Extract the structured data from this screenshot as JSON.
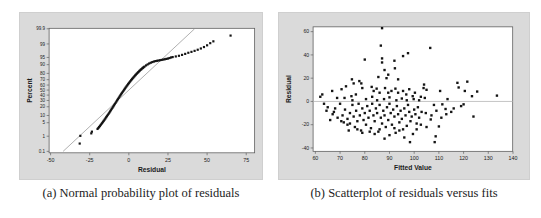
{
  "captions": {
    "a": "(a) Normal probability plot of residuals",
    "b": "(b) Scatterplot of residuals versus fits"
  },
  "colors": {
    "panel_bg": "#dadada",
    "plot_bg": "#ffffff",
    "frame": "#5f5f5f",
    "point": "#141414",
    "fit_line": "#8d8d8d",
    "ref_line": "#b4b4b4",
    "tick_text": "#1a1a1a"
  },
  "chart_data": [
    {
      "id": "a",
      "type": "scatter",
      "scale": "normal-probability",
      "title": "",
      "xlabel": "Residual",
      "ylabel": "Percent",
      "xticks": [
        -50,
        -25,
        0,
        25,
        50,
        75
      ],
      "yticks": [
        99.9,
        99,
        95,
        90,
        80,
        70,
        60,
        50,
        40,
        30,
        20,
        10,
        5,
        1,
        0.1
      ],
      "xlim": [
        -51,
        80
      ],
      "percent_lim": [
        0.1,
        99.9
      ],
      "legend": "none",
      "grid": false,
      "fit_line": {
        "x": [
          -42,
          42
        ],
        "percent": [
          0.1,
          99.9
        ]
      },
      "points": [
        [
          -31.4,
          0.35
        ],
        [
          -31,
          1.05
        ],
        [
          -24,
          1.45
        ],
        [
          -23.6,
          1.8
        ],
        [
          -20,
          2.5
        ],
        [
          -19.5,
          2.8
        ],
        [
          -19,
          3.1
        ],
        [
          -18.5,
          3.5
        ],
        [
          -18,
          3.9
        ],
        [
          -17.5,
          4.4
        ],
        [
          -17,
          4.9
        ],
        [
          -16.5,
          5.5
        ],
        [
          -16,
          6.1
        ],
        [
          -15.5,
          6.8
        ],
        [
          -15,
          7.6
        ],
        [
          -14.5,
          8.5
        ],
        [
          -14,
          9.4
        ],
        [
          -13.5,
          10.4
        ],
        [
          -13,
          11.5
        ],
        [
          -12.5,
          12.7
        ],
        [
          -12,
          14
        ],
        [
          -11.5,
          15.4
        ],
        [
          -11,
          16.9
        ],
        [
          -10.5,
          18.5
        ],
        [
          -10,
          20.2
        ],
        [
          -9.5,
          22
        ],
        [
          -9,
          23.9
        ],
        [
          -8.5,
          25.9
        ],
        [
          -8,
          28
        ],
        [
          -7.5,
          30.1
        ],
        [
          -7,
          32.3
        ],
        [
          -6.5,
          34.6
        ],
        [
          -6,
          36.9
        ],
        [
          -5.5,
          39.2
        ],
        [
          -5,
          41.5
        ],
        [
          -4.5,
          43.8
        ],
        [
          -4,
          46.1
        ],
        [
          -3.5,
          48.4
        ],
        [
          -3,
          50.7
        ],
        [
          -2.5,
          53
        ],
        [
          -2,
          55.2
        ],
        [
          -1.5,
          57.4
        ],
        [
          -1,
          59.5
        ],
        [
          -0.5,
          61.6
        ],
        [
          0,
          63.6
        ],
        [
          0.5,
          65.5
        ],
        [
          1,
          67.4
        ],
        [
          1.5,
          69.2
        ],
        [
          2,
          70.9
        ],
        [
          2.5,
          72.5
        ],
        [
          3,
          74
        ],
        [
          3.5,
          75.5
        ],
        [
          4,
          76.9
        ],
        [
          4.5,
          78.2
        ],
        [
          5,
          79.4
        ],
        [
          5.5,
          80.6
        ],
        [
          6,
          81.7
        ],
        [
          6.5,
          82.7
        ],
        [
          7,
          83.7
        ],
        [
          7.5,
          84.6
        ],
        [
          8,
          85.4
        ],
        [
          8.5,
          86.2
        ],
        [
          9,
          86.9
        ],
        [
          9.5,
          87.6
        ],
        [
          10,
          88.2
        ],
        [
          11,
          89.3
        ],
        [
          12,
          90.2
        ],
        [
          13,
          91
        ],
        [
          14,
          91.6
        ],
        [
          15,
          92.1
        ],
        [
          16,
          92.5
        ],
        [
          17,
          92.8
        ],
        [
          18,
          93
        ],
        [
          19,
          93.2
        ],
        [
          20,
          93.4
        ],
        [
          21,
          93.6
        ],
        [
          22,
          93.8
        ],
        [
          23,
          94
        ],
        [
          24,
          94.2
        ],
        [
          25,
          94.4
        ],
        [
          26,
          94.7
        ],
        [
          27,
          95
        ],
        [
          28,
          95.2
        ],
        [
          30,
          95.5
        ],
        [
          32,
          95.8
        ],
        [
          34,
          96.2
        ],
        [
          36,
          96.6
        ],
        [
          38,
          97
        ],
        [
          40,
          97.3
        ],
        [
          42,
          97.6
        ],
        [
          44,
          97.9
        ],
        [
          46,
          98.2
        ],
        [
          48,
          98.5
        ],
        [
          50,
          98.8
        ],
        [
          52,
          99.1
        ],
        [
          54,
          99.3
        ],
        [
          65,
          99.7
        ]
      ]
    },
    {
      "id": "b",
      "type": "scatter",
      "xlabel": "Fitted Value",
      "ylabel": "Residual",
      "xticks": [
        60,
        70,
        80,
        90,
        100,
        110,
        120,
        130,
        140
      ],
      "yticks": [
        60,
        40,
        20,
        0,
        -20,
        -40
      ],
      "xlim": [
        59,
        140
      ],
      "ylim": [
        -43,
        64
      ],
      "legend": "none",
      "grid": false,
      "ref_line_y": 0,
      "points": [
        [
          87,
          63
        ],
        [
          86.5,
          48
        ],
        [
          80,
          36
        ],
        [
          87,
          37
        ],
        [
          87,
          33.5
        ],
        [
          92,
          35
        ],
        [
          95.5,
          39
        ],
        [
          97.5,
          41.5
        ],
        [
          106.5,
          46
        ],
        [
          88,
          27
        ],
        [
          89.5,
          23
        ],
        [
          88.8,
          20
        ],
        [
          85.5,
          21
        ],
        [
          92.2,
          28.5
        ],
        [
          93.5,
          19
        ],
        [
          74.8,
          19
        ],
        [
          75.5,
          15.5
        ],
        [
          72.4,
          13
        ],
        [
          77.8,
          17.5
        ],
        [
          78.6,
          15.5
        ],
        [
          79,
          11.5
        ],
        [
          70.6,
          10.5
        ],
        [
          66.8,
          9
        ],
        [
          62.8,
          6
        ],
        [
          82.8,
          12.5
        ],
        [
          83.6,
          9
        ],
        [
          84.8,
          11
        ],
        [
          86,
          7.5
        ],
        [
          88.2,
          11.5
        ],
        [
          89.5,
          7.5
        ],
        [
          90.8,
          9
        ],
        [
          92.4,
          11
        ],
        [
          93.5,
          7.5
        ],
        [
          95.5,
          9
        ],
        [
          96.8,
          6
        ],
        [
          98,
          10.5
        ],
        [
          76.4,
          6
        ],
        [
          74.6,
          4.5
        ],
        [
          68.8,
          3
        ],
        [
          104,
          14.5
        ],
        [
          103.8,
          11.5
        ],
        [
          105,
          10
        ],
        [
          100.3,
          7.5
        ],
        [
          99.4,
          4.5
        ],
        [
          102.7,
          4
        ],
        [
          104.3,
          3
        ],
        [
          117.5,
          16
        ],
        [
          118,
          12
        ],
        [
          121.5,
          17
        ],
        [
          123.4,
          4.5
        ],
        [
          133.5,
          5
        ],
        [
          120.5,
          9
        ],
        [
          125.5,
          8.5
        ],
        [
          62,
          4
        ],
        [
          63.5,
          -2
        ],
        [
          64.5,
          -8
        ],
        [
          65,
          -5
        ],
        [
          66,
          -16
        ],
        [
          67,
          -11
        ],
        [
          67.5,
          -9
        ],
        [
          68,
          -6
        ],
        [
          69,
          -14
        ],
        [
          70,
          -2
        ],
        [
          70.5,
          -17
        ],
        [
          71,
          -12
        ],
        [
          71.5,
          -18
        ],
        [
          72,
          -7
        ],
        [
          73,
          -15
        ],
        [
          73,
          -20
        ],
        [
          73.5,
          -25
        ],
        [
          74,
          -10
        ],
        [
          74,
          -19
        ],
        [
          75,
          -3
        ],
        [
          75.5,
          -13
        ],
        [
          76,
          -22
        ],
        [
          76.5,
          -8
        ],
        [
          77,
          -17
        ],
        [
          77,
          -24
        ],
        [
          77.5,
          -2
        ],
        [
          78,
          -12
        ],
        [
          78.5,
          -25
        ],
        [
          79,
          -6
        ],
        [
          79,
          -27
        ],
        [
          79.5,
          -16
        ],
        [
          80,
          -10
        ],
        [
          80.5,
          -20
        ],
        [
          81,
          -4
        ],
        [
          81.5,
          -14
        ],
        [
          82,
          -8
        ],
        [
          82,
          -26
        ],
        [
          82.5,
          -23
        ],
        [
          83,
          -2
        ],
        [
          83.5,
          -12
        ],
        [
          84,
          -17
        ],
        [
          84,
          -28
        ],
        [
          84.5,
          -6
        ],
        [
          85,
          -10
        ],
        [
          85.5,
          -26
        ],
        [
          86,
          -3
        ],
        [
          86,
          -24
        ],
        [
          86.5,
          -14
        ],
        [
          87,
          -19
        ],
        [
          87.5,
          -8
        ],
        [
          88,
          -12
        ],
        [
          88,
          -32
        ],
        [
          88.5,
          -22
        ],
        [
          89,
          -5
        ],
        [
          89.5,
          -16
        ],
        [
          90,
          -2
        ],
        [
          90,
          -29
        ],
        [
          90.5,
          -10
        ],
        [
          91,
          -20
        ],
        [
          91.5,
          -7
        ],
        [
          92,
          -13
        ],
        [
          92,
          -23
        ],
        [
          92.5,
          -27
        ],
        [
          93,
          -4
        ],
        [
          93.5,
          -11
        ],
        [
          94,
          -18
        ],
        [
          94,
          -25
        ],
        [
          94.5,
          -8
        ],
        [
          95,
          -15
        ],
        [
          95.5,
          -24
        ],
        [
          96,
          -6
        ],
        [
          96,
          -31
        ],
        [
          96.5,
          -12
        ],
        [
          97,
          -21
        ],
        [
          97.5,
          -3
        ],
        [
          98,
          -9
        ],
        [
          98.3,
          -35
        ],
        [
          98.5,
          -17
        ],
        [
          99,
          -13
        ],
        [
          99.5,
          -28
        ],
        [
          100,
          -7
        ],
        [
          100.5,
          -11
        ],
        [
          101,
          -19
        ],
        [
          101,
          -24
        ],
        [
          101.5,
          -5
        ],
        [
          102,
          -14
        ],
        [
          102.7,
          -20
        ],
        [
          103,
          -9
        ],
        [
          104.7,
          -10
        ],
        [
          105,
          -22
        ],
        [
          106.7,
          -15.5
        ],
        [
          107,
          -12
        ],
        [
          108,
          -3
        ],
        [
          108.3,
          -35
        ],
        [
          108.7,
          -30
        ],
        [
          109,
          -8
        ],
        [
          110,
          -21.5
        ],
        [
          111,
          -14
        ],
        [
          111.4,
          -2.5
        ],
        [
          112.7,
          -6.5
        ],
        [
          113,
          -11
        ],
        [
          115,
          -9
        ],
        [
          116,
          -6
        ],
        [
          119,
          -4
        ],
        [
          120,
          -2.5
        ],
        [
          124,
          -13
        ],
        [
          80.5,
          2
        ],
        [
          83,
          4
        ],
        [
          85,
          1
        ],
        [
          87.8,
          2
        ],
        [
          90,
          3.5
        ],
        [
          92.8,
          1
        ],
        [
          95,
          2.5
        ],
        [
          97,
          1
        ],
        [
          99.8,
          2
        ],
        [
          102,
          1
        ],
        [
          75,
          1
        ],
        [
          71.8,
          3
        ],
        [
          110.5,
          9
        ],
        [
          113.5,
          2
        ]
      ]
    }
  ]
}
